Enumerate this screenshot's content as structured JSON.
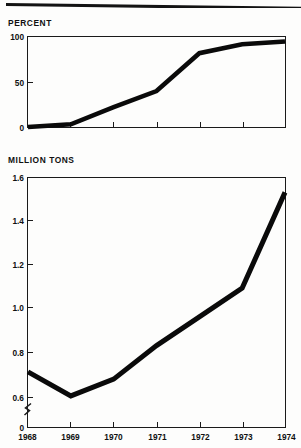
{
  "page": {
    "top_rule_name": "horizontal-rule"
  },
  "charts": [
    {
      "id": "percent-chart",
      "unit_label": "PERCENT",
      "ytick_labels": [
        "100",
        "50",
        "0"
      ],
      "xtick_labels": [],
      "axis_break": false
    },
    {
      "id": "million-tons-chart",
      "unit_label": "MILLION TONS",
      "ytick_labels": [
        "1.6",
        "1.4",
        "1.2",
        "1.0",
        "0.8",
        "0.6",
        "0"
      ],
      "xtick_labels": [
        "1968",
        "1969",
        "1970",
        "1971",
        "1972",
        "1973",
        "1974"
      ],
      "axis_break": true
    }
  ],
  "chart_data": [
    {
      "type": "line",
      "id": "percent-chart",
      "title": "",
      "ylabel": "PERCENT",
      "xlabel": "",
      "x": [
        1968,
        1969,
        1970,
        1971,
        1972,
        1973,
        1974
      ],
      "values": [
        0,
        3,
        22,
        40,
        82,
        92,
        95
      ],
      "ylim": [
        0,
        100
      ],
      "yticks": [
        0,
        50,
        100
      ],
      "xlim": [
        1968,
        1974
      ],
      "xticks": [
        1968,
        1969,
        1970,
        1971,
        1972,
        1973,
        1974
      ],
      "grid": false,
      "legend": "none",
      "axis_break": false,
      "line_color": "#0a0a0a",
      "line_width_px": 4.5
    },
    {
      "type": "line",
      "id": "million-tons-chart",
      "title": "",
      "ylabel": "MILLION TONS",
      "xlabel": "",
      "x": [
        1968,
        1969,
        1970,
        1971,
        1972,
        1973,
        1974
      ],
      "values": [
        0.79,
        0.69,
        0.76,
        0.9,
        1.02,
        1.14,
        1.54
      ],
      "ylim": [
        0.56,
        1.6
      ],
      "yticks": [
        0.6,
        0.8,
        1.0,
        1.2,
        1.4,
        1.6
      ],
      "y_zero_tick": 0,
      "xlim": [
        1968,
        1974
      ],
      "xticks": [
        1968,
        1969,
        1970,
        1971,
        1972,
        1973,
        1974
      ],
      "grid": false,
      "legend": "none",
      "axis_break": true,
      "axis_break_note": "y-axis broken between 0 and 0.6",
      "line_color": "#0a0a0a",
      "line_width_px": 5
    }
  ],
  "colors": {
    "ink": "#0a0a0a",
    "axis": "#1a1a1a",
    "paper": "#fdfdfc"
  }
}
